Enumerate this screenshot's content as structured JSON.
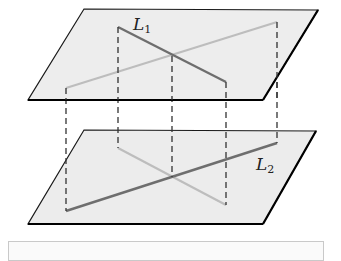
{
  "figure": {
    "type": "two parallel planes with line projections",
    "upper_plane": {
      "line_label": "L",
      "line_subscript": "1"
    },
    "lower_plane": {
      "line_label": "L",
      "line_subscript": "2"
    }
  },
  "caption": ""
}
